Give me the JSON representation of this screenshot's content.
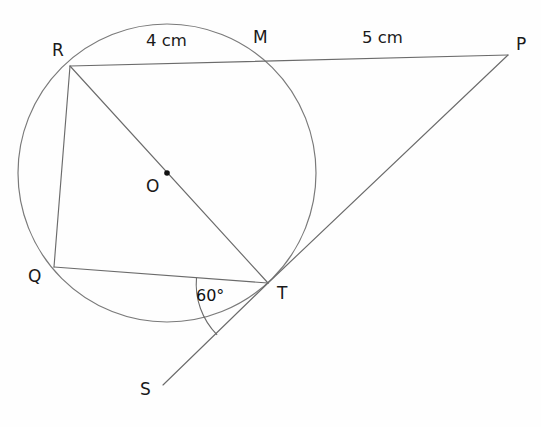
{
  "figure": {
    "background_color": "#fefefe",
    "stroke_color": "#6b6b6b",
    "label_color": "#1a1a1a"
  },
  "circle": {
    "center_label": "O",
    "center_x": 167,
    "center_y": 173,
    "radius": 149,
    "center_dot_label": "center-dot"
  },
  "points": {
    "R": {
      "label": "R",
      "x": 70,
      "y": 66,
      "label_x": 52,
      "label_y": 42
    },
    "M": {
      "label": "M",
      "x": 258,
      "y": 60,
      "label_x": 253,
      "label_y": 29
    },
    "P": {
      "label": "P",
      "x": 508,
      "y": 55,
      "label_x": 516,
      "label_y": 36
    },
    "Q": {
      "label": "Q",
      "x": 54,
      "y": 267,
      "label_x": 28,
      "label_y": 268
    },
    "T": {
      "label": "T",
      "x": 268,
      "y": 283,
      "label_x": 277,
      "label_y": 285
    },
    "S": {
      "label": "S",
      "x": 163,
      "y": 385,
      "label_x": 140,
      "label_y": 381
    },
    "O": {
      "label": "O",
      "x": 167,
      "y": 173,
      "label_x": 146,
      "label_y": 178
    }
  },
  "segments": [
    {
      "name": "segment-RP",
      "from": "R",
      "to": "P"
    },
    {
      "name": "segment-RQ",
      "from": "R",
      "to": "Q"
    },
    {
      "name": "segment-RT",
      "from": "R",
      "to": "T"
    },
    {
      "name": "segment-QT",
      "from": "Q",
      "to": "T"
    },
    {
      "name": "segment-TP",
      "from": "T",
      "to": "P"
    },
    {
      "name": "segment-TS",
      "from": "T",
      "to": "S"
    }
  ],
  "measurements": {
    "rm_length": "4 cm",
    "rm_label_x": 146,
    "rm_label_y": 33,
    "mp_length": "5 cm",
    "mp_label_x": 362,
    "mp_label_y": 30
  },
  "angle": {
    "value": "60°",
    "label_x": 196,
    "label_y": 288,
    "vertex": "T",
    "between": [
      "QT",
      "TS"
    ],
    "arc_radius": 72
  }
}
